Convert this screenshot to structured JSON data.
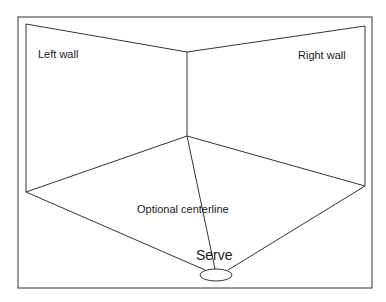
{
  "diagram": {
    "type": "room-perspective",
    "labels": {
      "left_wall": "Left wall",
      "right_wall": "Right wall",
      "centerline": "Optional centerline",
      "serve": "Serve"
    },
    "colors": {
      "stroke": "#333333",
      "background": "#ffffff",
      "text": "#1a1a1a"
    }
  }
}
